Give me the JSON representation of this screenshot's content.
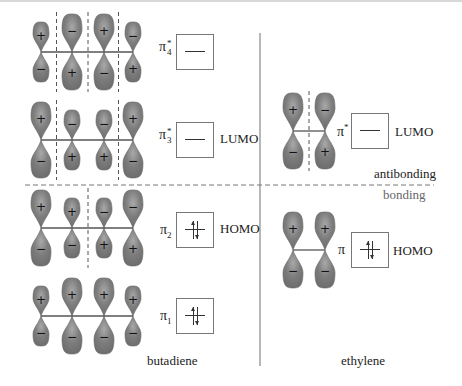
{
  "colors": {
    "lobe": "#7d7d7d",
    "lobe_highlight": "#a9a9a9",
    "line": "#555555",
    "divider": "#888888"
  },
  "section_labels": {
    "antibonding": "antibonding",
    "bonding": "bonding"
  },
  "molecules": {
    "butadiene": {
      "name": "butadiene",
      "orbitals": [
        {
          "id": "pi4star",
          "symbol": "π",
          "superscript": "*",
          "subscript": "4",
          "role": "",
          "electrons": 0,
          "signs": [
            "+",
            "-",
            "+",
            "-"
          ],
          "sizes": [
            "small",
            "large",
            "large",
            "small"
          ],
          "nodes": 3
        },
        {
          "id": "pi3star",
          "symbol": "π",
          "superscript": "*",
          "subscript": "3",
          "role": "LUMO",
          "electrons": 0,
          "signs": [
            "+",
            "-",
            "-",
            "+"
          ],
          "sizes": [
            "large",
            "small",
            "small",
            "large"
          ],
          "nodes": 2
        },
        {
          "id": "pi2",
          "symbol": "π",
          "superscript": "",
          "subscript": "2",
          "role": "HOMO",
          "electrons": 2,
          "signs": [
            "+",
            "+",
            "-",
            "-"
          ],
          "sizes": [
            "large",
            "small",
            "small",
            "large"
          ],
          "nodes": 1
        },
        {
          "id": "pi1",
          "symbol": "π",
          "superscript": "",
          "subscript": "1",
          "role": "",
          "electrons": 2,
          "signs": [
            "+",
            "+",
            "+",
            "+"
          ],
          "sizes": [
            "small",
            "large",
            "large",
            "small"
          ],
          "nodes": 0
        }
      ]
    },
    "ethylene": {
      "name": "ethylene",
      "orbitals": [
        {
          "id": "pistar",
          "symbol": "π",
          "superscript": "*",
          "subscript": "",
          "role": "LUMO",
          "electrons": 0,
          "signs": [
            "+",
            "-"
          ],
          "sizes": [
            "large",
            "large"
          ],
          "nodes": 1
        },
        {
          "id": "pi",
          "symbol": "π",
          "superscript": "",
          "subscript": "",
          "role": "HOMO",
          "electrons": 2,
          "signs": [
            "+",
            "+"
          ],
          "sizes": [
            "large",
            "large"
          ],
          "nodes": 0
        }
      ]
    }
  }
}
